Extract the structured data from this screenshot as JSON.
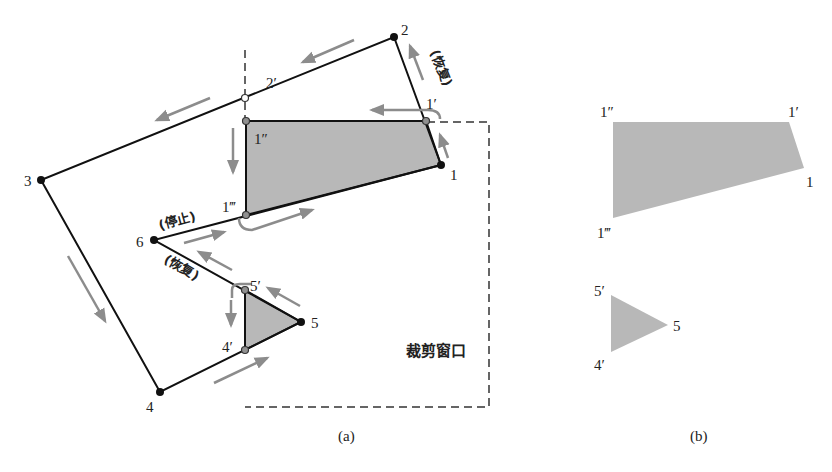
{
  "figure": {
    "panel_a": {
      "caption": "(a)",
      "clip_window_label": "裁剪窗口",
      "vertices": [
        {
          "id": "v1",
          "label": "1"
        },
        {
          "id": "v2",
          "label": "2"
        },
        {
          "id": "v3",
          "label": "3"
        },
        {
          "id": "v4",
          "label": "4"
        },
        {
          "id": "v5",
          "label": "5"
        },
        {
          "id": "v6",
          "label": "6"
        }
      ],
      "intersections": [
        {
          "id": "p1p",
          "label": "1′"
        },
        {
          "id": "p2p",
          "label": "2′"
        },
        {
          "id": "p1pp",
          "label": "1″"
        },
        {
          "id": "p1ppp",
          "label": "1‴"
        },
        {
          "id": "p5p",
          "label": "5′"
        },
        {
          "id": "p4p",
          "label": "4′"
        }
      ],
      "annotations": {
        "resume_top": "(恢复)",
        "stop": "(停止)",
        "resume_mid": "(恢复)"
      }
    },
    "panel_b": {
      "caption": "(b)",
      "polygon1_labels": {
        "a": "1″",
        "b": "1′",
        "c": "1",
        "d": "1‴"
      },
      "polygon2_labels": {
        "a": "5′",
        "b": "5",
        "c": "4′"
      }
    },
    "colors": {
      "edge": "#111111",
      "fill": "#b8b8b8",
      "arrow": "#8c8c8c",
      "dash": "#333333",
      "intersection": "#909090"
    }
  }
}
